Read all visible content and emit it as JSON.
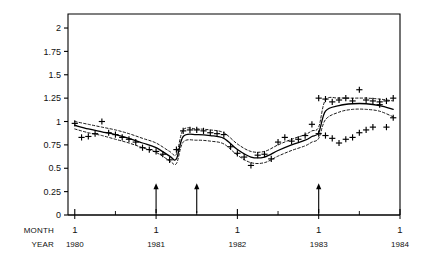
{
  "chart_data": {
    "type": "scatter",
    "title": "",
    "subtitle": "",
    "xlabel_rows": [
      "MONTH",
      "YEAR"
    ],
    "ylabel": "",
    "xlim": [
      0,
      49
    ],
    "ylim": [
      0,
      2.15
    ],
    "grid": false,
    "legend": "none",
    "yticks": [
      0,
      0.25,
      0.5,
      0.75,
      1,
      1.25,
      1.5,
      1.75,
      2
    ],
    "ytick_labels": [
      "0",
      "0.25",
      "0.5",
      "0.75",
      "1",
      "1.25",
      "1.5",
      "1.75",
      "2"
    ],
    "xticks": [
      1,
      13,
      25,
      37,
      49
    ],
    "xtick_month_labels": [
      "1",
      "1",
      "1",
      "1",
      "1"
    ],
    "xtick_year_labels": [
      "1980",
      "1981",
      "1982",
      "1983",
      "1984"
    ],
    "series": [
      {
        "name": "observed",
        "marker": "plus",
        "style": "points",
        "x": [
          1,
          2,
          3,
          4,
          5,
          6,
          7,
          8,
          9,
          10,
          11,
          12,
          13,
          14,
          15,
          16,
          17,
          18,
          19,
          20,
          21,
          22,
          23,
          24,
          25,
          26,
          27,
          28,
          29,
          30,
          31,
          32,
          33,
          34,
          35,
          36,
          37,
          38,
          39,
          40,
          41,
          42,
          43,
          44,
          45,
          46,
          47,
          48
        ],
        "y": [
          0.98,
          0.83,
          0.84,
          0.87,
          1.0,
          0.88,
          0.86,
          0.83,
          0.81,
          0.78,
          0.72,
          0.7,
          0.68,
          0.65,
          0.59,
          0.7,
          0.9,
          0.91,
          0.91,
          0.9,
          0.88,
          0.87,
          0.86,
          0.73,
          0.66,
          0.62,
          0.53,
          0.64,
          0.65,
          0.6,
          0.78,
          0.83,
          0.79,
          0.81,
          0.85,
          0.97,
          0.87,
          0.85,
          0.82,
          0.77,
          0.81,
          0.83,
          0.88,
          0.91,
          0.94,
          1.21,
          1.22,
          1.25
        ]
      },
      {
        "name": "observed-upper-cluster",
        "marker": "plus",
        "style": "points",
        "x": [
          37,
          38,
          39,
          40,
          41,
          42,
          43,
          44,
          45,
          46,
          47,
          48
        ],
        "y": [
          1.25,
          1.24,
          1.21,
          1.23,
          1.25,
          1.22,
          1.34,
          1.23,
          1.22,
          1.18,
          0.94,
          1.04
        ]
      },
      {
        "name": "fitted",
        "style": "line",
        "linestyle": "solid",
        "x": [
          1,
          3,
          5,
          7,
          9,
          11,
          13,
          15,
          16,
          17,
          19,
          21,
          23,
          25,
          27,
          29,
          31,
          33,
          35,
          36,
          37,
          38,
          40,
          42,
          44,
          46,
          48
        ],
        "y": [
          0.96,
          0.92,
          0.89,
          0.86,
          0.82,
          0.77,
          0.72,
          0.63,
          0.6,
          0.84,
          0.86,
          0.85,
          0.82,
          0.7,
          0.62,
          0.62,
          0.69,
          0.75,
          0.8,
          0.84,
          0.88,
          1.11,
          1.17,
          1.19,
          1.19,
          1.17,
          1.13
        ]
      },
      {
        "name": "upper-band",
        "style": "line",
        "linestyle": "dashed",
        "x": [
          1,
          3,
          5,
          7,
          9,
          11,
          13,
          15,
          16,
          17,
          19,
          21,
          23,
          25,
          27,
          29,
          31,
          33,
          35,
          36,
          37,
          38,
          40,
          42,
          44,
          46,
          48
        ],
        "y": [
          1.0,
          0.97,
          0.94,
          0.91,
          0.87,
          0.82,
          0.77,
          0.68,
          0.65,
          0.91,
          0.92,
          0.91,
          0.88,
          0.76,
          0.68,
          0.68,
          0.75,
          0.81,
          0.86,
          0.9,
          0.94,
          1.23,
          1.25,
          1.25,
          1.25,
          1.24,
          1.22
        ]
      },
      {
        "name": "lower-band",
        "style": "line",
        "linestyle": "dashed",
        "x": [
          1,
          3,
          5,
          7,
          9,
          11,
          13,
          15,
          16,
          17,
          19,
          21,
          23,
          25,
          27,
          29,
          31,
          33,
          35,
          36,
          37,
          38,
          40,
          42,
          44,
          46,
          48
        ],
        "y": [
          0.92,
          0.88,
          0.85,
          0.81,
          0.77,
          0.72,
          0.67,
          0.58,
          0.55,
          0.78,
          0.8,
          0.79,
          0.76,
          0.64,
          0.56,
          0.56,
          0.63,
          0.69,
          0.74,
          0.78,
          0.82,
          1.02,
          1.1,
          1.13,
          1.13,
          1.11,
          1.05
        ]
      }
    ],
    "annotations": [
      {
        "type": "arrow",
        "direction": "up",
        "x": 13,
        "label": ""
      },
      {
        "type": "arrow",
        "direction": "up",
        "x": 19,
        "label": ""
      },
      {
        "type": "arrow",
        "direction": "up",
        "x": 37,
        "label": ""
      }
    ],
    "colors": {
      "axis": "#000000",
      "marker": "#000000",
      "fitted_line": "#000000",
      "band_line": "#000000",
      "background": "#ffffff"
    }
  }
}
